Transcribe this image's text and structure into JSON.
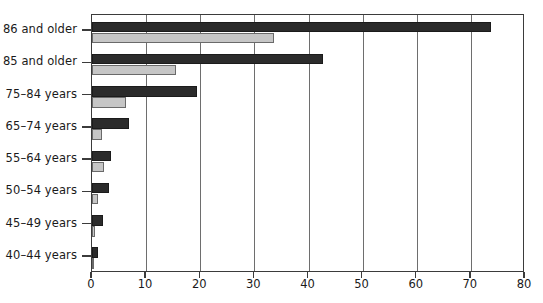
{
  "chart_data": {
    "type": "bar",
    "orientation": "horizontal",
    "title": "",
    "subtitle": "",
    "xlabel": "",
    "ylabel": "",
    "xlim": [
      0,
      80
    ],
    "xticks": [
      0,
      10,
      20,
      30,
      40,
      50,
      60,
      70,
      80
    ],
    "xtick_labels": [
      "0",
      "10",
      "20",
      "30",
      "40",
      "50",
      "60",
      "70",
      "80"
    ],
    "grid": "vertical",
    "legend": "none",
    "categories": [
      "86 and older",
      "85 and older",
      "75–84 years",
      "65–74 years",
      "55–64 years",
      "50–54 years",
      "45–49 years",
      "40–44 years"
    ],
    "series": [
      {
        "name": "series-dark",
        "color": "#2b2b2b",
        "values": [
          73.7,
          42.7,
          19.4,
          6.8,
          3.5,
          3.1,
          2.0,
          1.2
        ]
      },
      {
        "name": "series-light",
        "color": "#c6c6c6",
        "values": [
          33.6,
          15.5,
          6.3,
          1.8,
          2.2,
          1.1,
          0.6,
          0.3
        ]
      }
    ]
  },
  "axis": {
    "frame_color": "#3b3b3b",
    "grid_color": "#6e6e6e"
  }
}
